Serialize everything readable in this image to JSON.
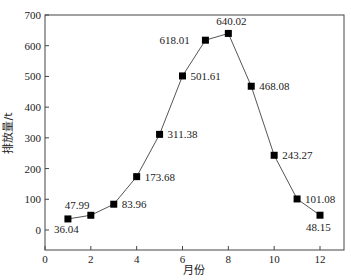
{
  "chart_data": {
    "type": "line",
    "title": "",
    "xlabel": "月份",
    "ylabel": "排放量/t",
    "xlim": [
      0,
      13
    ],
    "ylim": [
      -70,
      700
    ],
    "grid": false,
    "legend": null,
    "x_ticks": [
      0,
      2,
      4,
      6,
      8,
      10,
      12
    ],
    "y_ticks": [
      0,
      100,
      200,
      300,
      400,
      500,
      600,
      700
    ],
    "marker": "square",
    "line_color": "#555555",
    "marker_color": "#000000",
    "x": [
      1,
      2,
      3,
      4,
      5,
      6,
      7,
      8,
      9,
      10,
      11,
      12
    ],
    "values": [
      36.04,
      47.99,
      83.96,
      173.68,
      311.38,
      501.61,
      618.01,
      640.02,
      468.08,
      243.27,
      101.08,
      48.15
    ],
    "labels": [
      "36.04",
      "47.99",
      "83.96",
      "173.68",
      "311.38",
      "501.61",
      "618.01",
      "640.02",
      "468.08",
      "243.27",
      "101.08",
      "48.15"
    ],
    "label_offsets": [
      [
        -14,
        14
      ],
      [
        -26,
        -6
      ],
      [
        8,
        4
      ],
      [
        8,
        4
      ],
      [
        8,
        4
      ],
      [
        8,
        4
      ],
      [
        -46,
        4
      ],
      [
        -12,
        -8
      ],
      [
        8,
        4
      ],
      [
        8,
        4
      ],
      [
        8,
        4
      ],
      [
        -14,
        16
      ]
    ]
  }
}
